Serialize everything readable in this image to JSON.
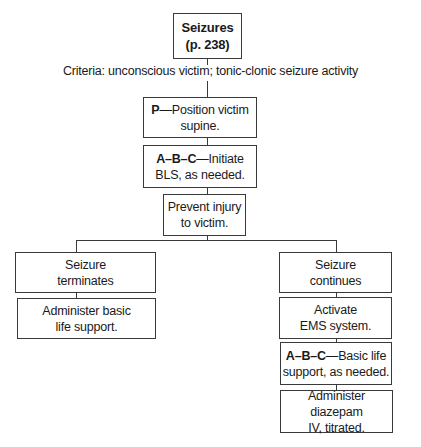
{
  "diagram": {
    "title_box": {
      "line1": "Seizures",
      "line2": "(p. 238)"
    },
    "criteria": "Criteria: unconscious victim; tonic-clonic seizure activity",
    "steps": [
      {
        "bold": "P",
        "dash": "—",
        "line1_rest": "Position victim",
        "line2": "supine."
      },
      {
        "bold": "A–B–C",
        "dash": "—",
        "line1_rest": "Initiate",
        "line2": "BLS, as needed."
      },
      {
        "line1": "Prevent injury",
        "line2": "to victim."
      }
    ],
    "left_branch": [
      {
        "line1": "Seizure",
        "line2": "terminates"
      },
      {
        "line1": "Administer basic",
        "line2": "life support."
      }
    ],
    "right_branch": [
      {
        "line1": "Seizure",
        "line2": "continues"
      },
      {
        "line1": "Activate",
        "line2": "EMS system."
      },
      {
        "bold": "A–B–C",
        "dash": "—",
        "line1_rest": "Basic life",
        "line2": "support, as needed."
      },
      {
        "line1": "Administer diazepam",
        "line2": "IV, titrated."
      }
    ]
  }
}
